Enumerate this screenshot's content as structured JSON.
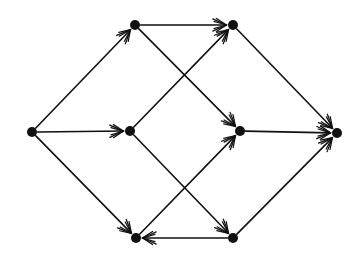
{
  "figure": {
    "kind": "directed-graph",
    "title": "",
    "background_color": "#ffffff",
    "ink_color": "#111111",
    "width": 364,
    "height": 262
  },
  "chart_data": {
    "type": "diagram",
    "subtype": "directed-graph",
    "title": "",
    "xlabel": "",
    "ylabel": "",
    "grid": false,
    "legend": "none",
    "directed": true,
    "node_count": 8,
    "edge_count": 12,
    "node_radius": 5,
    "node_color": "#111111",
    "edge_color": "#111111",
    "edge_width": 1.6,
    "arrowhead": "open-barbed",
    "nodes": [
      {
        "id": "n1",
        "label": "",
        "x": 32,
        "y": 132,
        "role": "source"
      },
      {
        "id": "n2",
        "label": "",
        "x": 135,
        "y": 25,
        "role": "upper-left"
      },
      {
        "id": "n3",
        "label": "",
        "x": 233,
        "y": 25,
        "role": "upper-right"
      },
      {
        "id": "n4",
        "label": "",
        "x": 130,
        "y": 131,
        "role": "middle-left"
      },
      {
        "id": "n5",
        "label": "",
        "x": 240,
        "y": 131,
        "role": "middle-right"
      },
      {
        "id": "n6",
        "label": "",
        "x": 136,
        "y": 238,
        "role": "lower-left"
      },
      {
        "id": "n7",
        "label": "",
        "x": 233,
        "y": 238,
        "role": "lower-right"
      },
      {
        "id": "n8",
        "label": "",
        "x": 337,
        "y": 133,
        "role": "sink"
      }
    ],
    "edges": [
      {
        "from": "n1",
        "to": "n2",
        "label": "",
        "direction": "up-right"
      },
      {
        "from": "n1",
        "to": "n4",
        "label": "",
        "direction": "right"
      },
      {
        "from": "n1",
        "to": "n6",
        "label": "",
        "direction": "down-right"
      },
      {
        "from": "n2",
        "to": "n3",
        "label": "",
        "direction": "right"
      },
      {
        "from": "n2",
        "to": "n5",
        "label": "",
        "direction": "down-right"
      },
      {
        "from": "n4",
        "to": "n3",
        "label": "",
        "direction": "up-right"
      },
      {
        "from": "n4",
        "to": "n7",
        "label": "",
        "direction": "down-right"
      },
      {
        "from": "n6",
        "to": "n5",
        "label": "",
        "direction": "up-right"
      },
      {
        "from": "n7",
        "to": "n6",
        "label": "",
        "direction": "left"
      },
      {
        "from": "n3",
        "to": "n8",
        "label": "",
        "direction": "down-right"
      },
      {
        "from": "n5",
        "to": "n8",
        "label": "",
        "direction": "right"
      },
      {
        "from": "n7",
        "to": "n8",
        "label": "",
        "direction": "up-right"
      }
    ]
  }
}
